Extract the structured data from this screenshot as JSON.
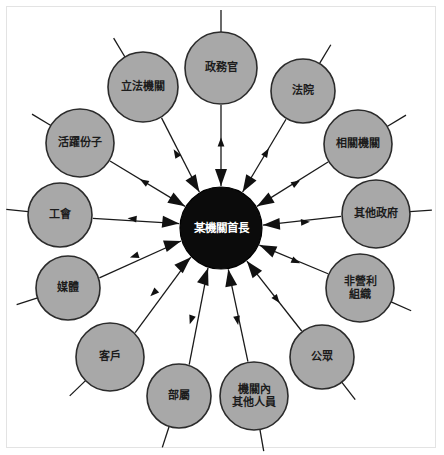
{
  "diagram": {
    "type": "radial-hub-and-spoke",
    "title_text": "",
    "colors": {
      "node_fill": "#a8a8a8",
      "node_stroke": "#2b2b2b",
      "center_fill": "#0b0b0b",
      "center_text": "#ffffff",
      "node_text": "#1c1c1c",
      "line": "#1a1a1a",
      "frame": "#e3e3e3",
      "background": "#ffffff"
    },
    "center": {
      "label": "某機關首長",
      "lines": [
        "某機關首長"
      ],
      "cx": 221,
      "cy": 228,
      "r": 41
    },
    "geometry": {
      "ring_radius": 160,
      "node_radius": 34,
      "stub_length": 22
    },
    "edge_style": {
      "bidirectional": true,
      "inward_arrow": "large",
      "outward_arrow": "small"
    },
    "nodes": [
      {
        "id": "n1",
        "label": "政務官",
        "lines": [
          "政務官"
        ],
        "angle": -90,
        "cx": 221,
        "cy": 68,
        "r": 36
      },
      {
        "id": "n2",
        "label": "法院",
        "lines": [
          "法院"
        ],
        "angle": -59,
        "cx": 303,
        "cy": 91,
        "r": 32
      },
      {
        "id": "n3",
        "label": "相關機關",
        "lines": [
          "相關機關"
        ],
        "angle": -31,
        "cx": 358,
        "cy": 144,
        "r": 34
      },
      {
        "id": "n4",
        "label": "其他政府",
        "lines": [
          "其他政府"
        ],
        "angle": -4,
        "cx": 376,
        "cy": 214,
        "r": 34
      },
      {
        "id": "n5",
        "label": "非營利組織",
        "lines": [
          "非營利",
          "組織"
        ],
        "angle": 24,
        "cx": 360,
        "cy": 288,
        "r": 34
      },
      {
        "id": "n6",
        "label": "公眾",
        "lines": [
          "公眾"
        ],
        "angle": 52,
        "cx": 322,
        "cy": 357,
        "r": 32
      },
      {
        "id": "n7",
        "label": "機關內其他人員",
        "lines": [
          "機關內",
          "其他人員"
        ],
        "angle": 80,
        "cx": 254,
        "cy": 396,
        "r": 34
      },
      {
        "id": "n8",
        "label": "部屬",
        "lines": [
          "部屬"
        ],
        "angle": 108,
        "cx": 179,
        "cy": 396,
        "r": 32
      },
      {
        "id": "n9",
        "label": "客戶",
        "lines": [
          "客戶"
        ],
        "angle": 136,
        "cx": 110,
        "cy": 357,
        "r": 34
      },
      {
        "id": "n10",
        "label": "媒體",
        "lines": [
          "媒體"
        ],
        "angle": 162,
        "cx": 68,
        "cy": 288,
        "r": 32
      },
      {
        "id": "n11",
        "label": "工會",
        "lines": [
          "工會"
        ],
        "angle": 186,
        "cx": 60,
        "cy": 215,
        "r": 32
      },
      {
        "id": "n12",
        "label": "活躍份子",
        "lines": [
          "活躍份子"
        ],
        "angle": 211,
        "cx": 80,
        "cy": 143,
        "r": 34
      },
      {
        "id": "n13",
        "label": "立法機關",
        "lines": [
          "立法機關"
        ],
        "angle": 239,
        "cx": 143,
        "cy": 87,
        "r": 35
      }
    ]
  }
}
